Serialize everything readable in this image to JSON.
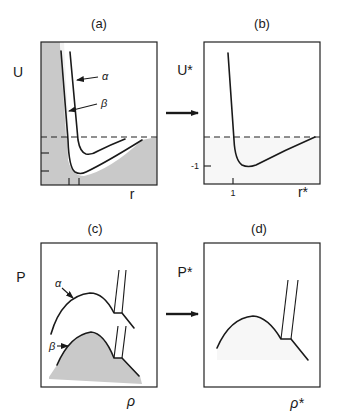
{
  "figure": {
    "colors": {
      "ink": "#1a1a1a",
      "shade": "#c9c9c9",
      "background": "#ffffff"
    },
    "panels": {
      "a": {
        "title": "(a)",
        "ylabel": "U",
        "xlabel": "r",
        "curve_labels": {
          "alpha": "α",
          "beta": "β"
        }
      },
      "b": {
        "title": "(b)",
        "ylabel": "U*",
        "xlabel": "r*",
        "ytick": "-1",
        "xtick": "1"
      },
      "c": {
        "title": "(c)",
        "ylabel": "P",
        "xlabel": "ρ",
        "curve_labels": {
          "alpha": "α",
          "beta": "β"
        }
      },
      "d": {
        "title": "(d)",
        "ylabel": "P*",
        "xlabel": "ρ*"
      }
    },
    "arrows": [
      {
        "from": "a",
        "to": "b",
        "label": "reduce"
      },
      {
        "from": "c",
        "to": "d",
        "label": "reduce"
      }
    ]
  }
}
